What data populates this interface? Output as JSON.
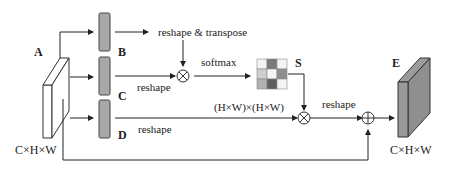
{
  "diagram": {
    "labels": {
      "A": "A",
      "B": "B",
      "C": "C",
      "D": "D",
      "E": "E",
      "S": "S"
    },
    "dims": {
      "input": "C×H×W",
      "output": "C×H×W",
      "attention": "(H×W)×(H×W)"
    },
    "ops": {
      "reshape_transpose": "reshape & transpose",
      "reshape_c": "reshape",
      "reshape_d": "reshape",
      "reshape_out": "reshape",
      "softmax": "softmax"
    },
    "symbols": {
      "multiply": "⊗",
      "add": "⊕"
    },
    "colors": {
      "line": "#222222",
      "feature_bar": "#a8a8a8",
      "output_block": "#8a8a8a",
      "input_block": "#ffffff"
    },
    "matrix_cells": [
      [
        "#f4f4f4",
        "#7a7a7a",
        "#f4f4f4"
      ],
      [
        "#cfcfcf",
        "#f4f4f4",
        "#8e8e8e"
      ],
      [
        "#b0b0b0",
        "#5e5e5e",
        "#f4f4f4"
      ]
    ]
  }
}
